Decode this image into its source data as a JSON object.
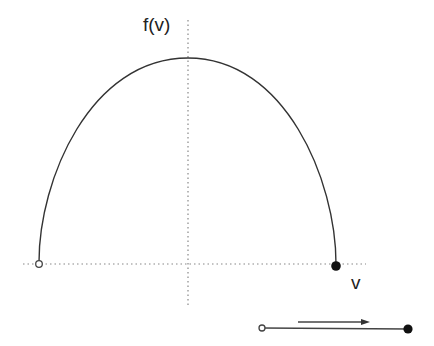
{
  "diagram": {
    "y_axis_label": "f(v)",
    "x_axis_label": "v",
    "curve": "semi-elliptical arc (f(v) vs v), open endpoint at left, closed endpoint at right",
    "left_endpoint": "open-circle",
    "right_endpoint": "filled-circle",
    "number_line": {
      "left_endpoint": "open-circle",
      "right_endpoint": "filled-circle",
      "arrow_direction": "right"
    },
    "colors": {
      "line": "#333333",
      "axis": "#888888",
      "background": "#ffffff"
    }
  }
}
